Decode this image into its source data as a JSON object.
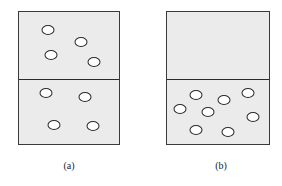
{
  "figure": {
    "panels": [
      {
        "id": "a",
        "caption": "(a)",
        "box": {
          "left": 18,
          "top": 11,
          "width": 102,
          "height": 134
        },
        "divider_y": 67,
        "caption_x": 69,
        "fill_color": "#ebebeb",
        "particles_upper": [
          [
            30,
            19
          ],
          [
            63,
            31
          ],
          [
            33,
            44
          ],
          [
            76,
            51
          ]
        ],
        "particles_lower": [
          [
            28,
            82
          ],
          [
            67,
            86
          ],
          [
            36,
            114
          ],
          [
            75,
            115
          ]
        ]
      },
      {
        "id": "b",
        "caption": "(b)",
        "box": {
          "left": 166,
          "top": 11,
          "width": 104,
          "height": 134
        },
        "divider_y": 67,
        "caption_x": 221,
        "fill_color": "#ebebeb",
        "particles_upper": [],
        "particles_lower": [
          [
            14,
            98
          ],
          [
            30,
            84
          ],
          [
            42,
            101
          ],
          [
            58,
            89
          ],
          [
            82,
            82
          ],
          [
            87,
            106
          ],
          [
            30,
            119
          ],
          [
            62,
            121
          ]
        ]
      }
    ],
    "particle_counts": {
      "a_upper": 4,
      "a_lower": 4,
      "b_upper": 0,
      "b_lower": 8
    }
  }
}
